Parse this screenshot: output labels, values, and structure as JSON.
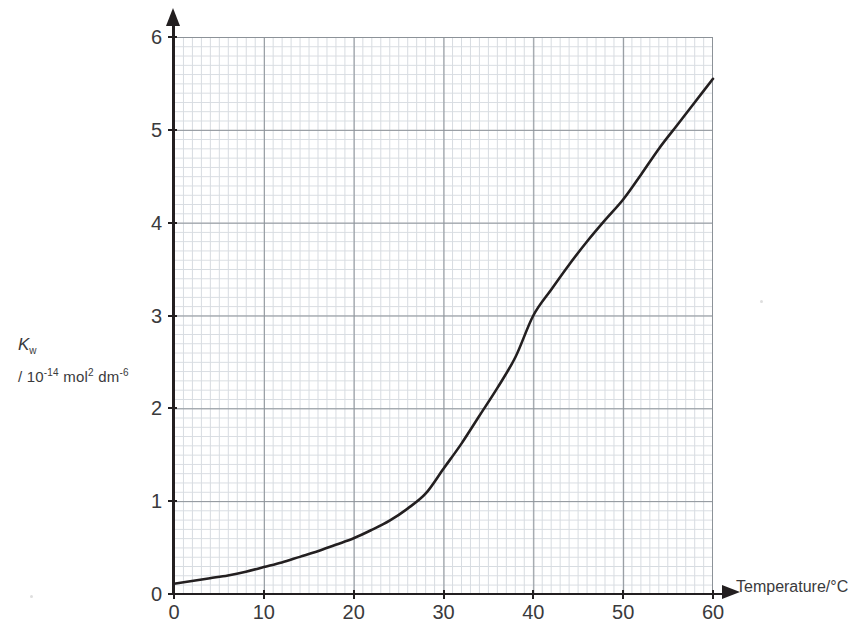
{
  "figure": {
    "background_color": "#ffffff",
    "ink_color": "#231f20",
    "grid_major_color": "#8c9298",
    "grid_minor_color": "#c9cfd6",
    "curve_color": "#231f20"
  },
  "axis_titles": {
    "y_symbol": "K",
    "y_symbol_subscript": "w",
    "y_units_prefix": "/ 10",
    "y_units_exp1": "-14",
    "y_units_mid": " mol",
    "y_units_exp2": "2",
    "y_units_mid2": " dm",
    "y_units_exp3": "-6",
    "y_full_text": "Kw / 10-14 mol2 dm-6",
    "x_text": "Temperature/°C"
  },
  "ticks": {
    "y_labels": [
      "0",
      "1",
      "2",
      "3",
      "4",
      "5",
      "6"
    ],
    "y_values": [
      0,
      1,
      2,
      3,
      4,
      5,
      6
    ],
    "x_labels": [
      "0",
      "10",
      "20",
      "30",
      "40",
      "50",
      "60"
    ],
    "x_values": [
      0,
      10,
      20,
      30,
      40,
      50,
      60
    ]
  },
  "chart_data": {
    "type": "line",
    "title": "",
    "subtitle": "",
    "xlabel": "Temperature/°C",
    "ylabel": "Kw / 10^-14 mol^2 dm^-6",
    "xlim": [
      0,
      60
    ],
    "ylim": [
      0,
      6
    ],
    "xticks": [
      0,
      10,
      20,
      30,
      40,
      50,
      60
    ],
    "yticks": [
      0,
      1,
      2,
      3,
      4,
      5,
      6
    ],
    "grid": true,
    "grid_minor": true,
    "minor_divisions_per_major": 10,
    "legend": null,
    "legend_position": "none",
    "annotations": [],
    "series": [
      {
        "name": "Kw",
        "x": [
          0,
          2,
          4,
          6,
          8,
          10,
          12,
          14,
          16,
          18,
          20,
          22,
          24,
          26,
          28,
          30,
          32,
          34,
          36,
          38,
          40,
          42,
          44,
          46,
          48,
          50,
          52,
          54,
          56,
          58,
          60
        ],
        "y": [
          0.11,
          0.14,
          0.17,
          0.2,
          0.24,
          0.29,
          0.34,
          0.4,
          0.46,
          0.53,
          0.6,
          0.69,
          0.79,
          0.92,
          1.08,
          1.35,
          1.62,
          1.92,
          2.22,
          2.55,
          3.0,
          3.28,
          3.55,
          3.8,
          4.03,
          4.25,
          4.52,
          4.8,
          5.05,
          5.3,
          5.55
        ]
      }
    ]
  }
}
